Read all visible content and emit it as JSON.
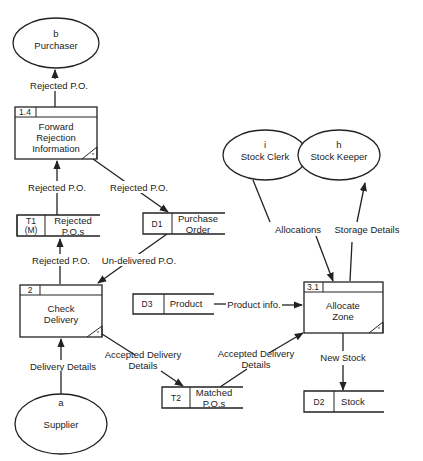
{
  "diagram": {
    "type": "data-flow-diagram",
    "externals": [
      {
        "id": "b",
        "label": "Purchaser"
      },
      {
        "id": "a",
        "label": "Supplier"
      },
      {
        "id": "i",
        "label": "Stock Clerk"
      },
      {
        "id": "h",
        "label": "Stock Keeper"
      }
    ],
    "processes": [
      {
        "id": "1.4",
        "line1": "Forward",
        "line2": "Rejection",
        "line3": "Information",
        "marker": "*"
      },
      {
        "id": "2",
        "line1": "Check",
        "line2": "Delivery",
        "marker": "*"
      },
      {
        "id": "3.1",
        "line1": "Allocate",
        "line2": "Zone",
        "marker": "*"
      }
    ],
    "stores": [
      {
        "id": "T1",
        "id2": "(M)",
        "line1": "Rejected",
        "line2": "P.O.s"
      },
      {
        "id": "D1",
        "line1": "Purchase",
        "line2": "Order"
      },
      {
        "id": "D3",
        "line1": "Product"
      },
      {
        "id": "T2",
        "line1": "Matched",
        "line2": "P.O.s"
      },
      {
        "id": "D2",
        "line1": "Stock"
      }
    ],
    "flows": [
      {
        "label": "Rejected P.O.",
        "from": "1.4",
        "to": "b"
      },
      {
        "label": "Rejected P.O.",
        "from": "T1",
        "to": "1.4"
      },
      {
        "label": "Rejected P.O.",
        "from": "1.4",
        "to": "D1"
      },
      {
        "label": "Rejected P.O.",
        "from": "2",
        "to": "T1"
      },
      {
        "label": "Un-delivered P.O.",
        "from": "D1",
        "to": "2"
      },
      {
        "label": "Delivery Details",
        "from": "a",
        "to": "2"
      },
      {
        "label1": "Accepted Delivery",
        "label2": "Details",
        "from": "2",
        "to": "T2"
      },
      {
        "label1": "Accepted Delivery",
        "label2": "Details",
        "from": "T2",
        "to": "3.1"
      },
      {
        "label": "Product info.",
        "from": "D3",
        "to": "3.1"
      },
      {
        "label": "Allocations",
        "from": "i",
        "to": "3.1"
      },
      {
        "label": "Storage Details",
        "from": "3.1",
        "to": "h"
      },
      {
        "label": "New Stock",
        "from": "3.1",
        "to": "D2"
      }
    ]
  }
}
